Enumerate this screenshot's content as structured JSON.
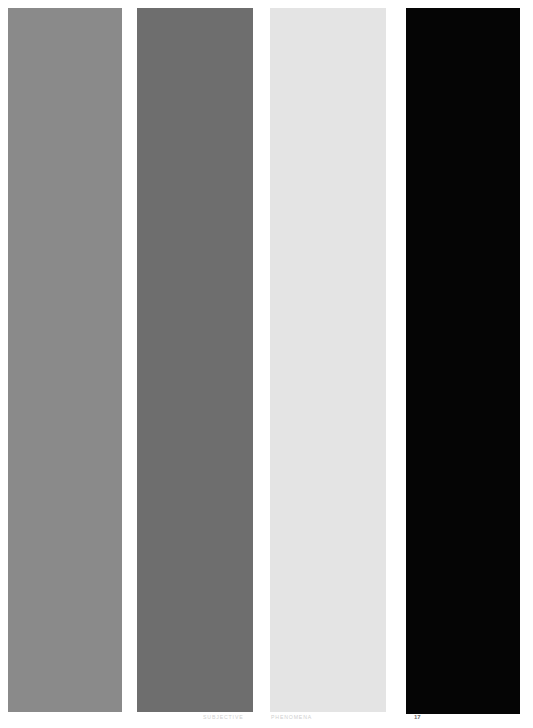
{
  "page": {
    "width": 533,
    "height": 728,
    "background_color": "#ffffff",
    "page_number": "17"
  },
  "panels": [
    {
      "id": "panel-1",
      "name": "medium-gray-bar",
      "color": "#8a8a8a",
      "caption": ""
    },
    {
      "id": "panel-2",
      "name": "dark-gray-bar",
      "color": "#6e6e6e",
      "caption": ""
    },
    {
      "id": "panel-3",
      "name": "light-gray-bar",
      "color": "#e4e4e4",
      "caption": ""
    },
    {
      "id": "panel-4",
      "name": "black-bar",
      "color": "#050505",
      "caption": ""
    }
  ],
  "captions": {
    "left_label": "SUBJECTIVE",
    "right_label": "PHENOMENA",
    "color": "#cfcfcf"
  },
  "footer": {
    "page_number": "17",
    "page_number_color": "#6d6d6d"
  }
}
